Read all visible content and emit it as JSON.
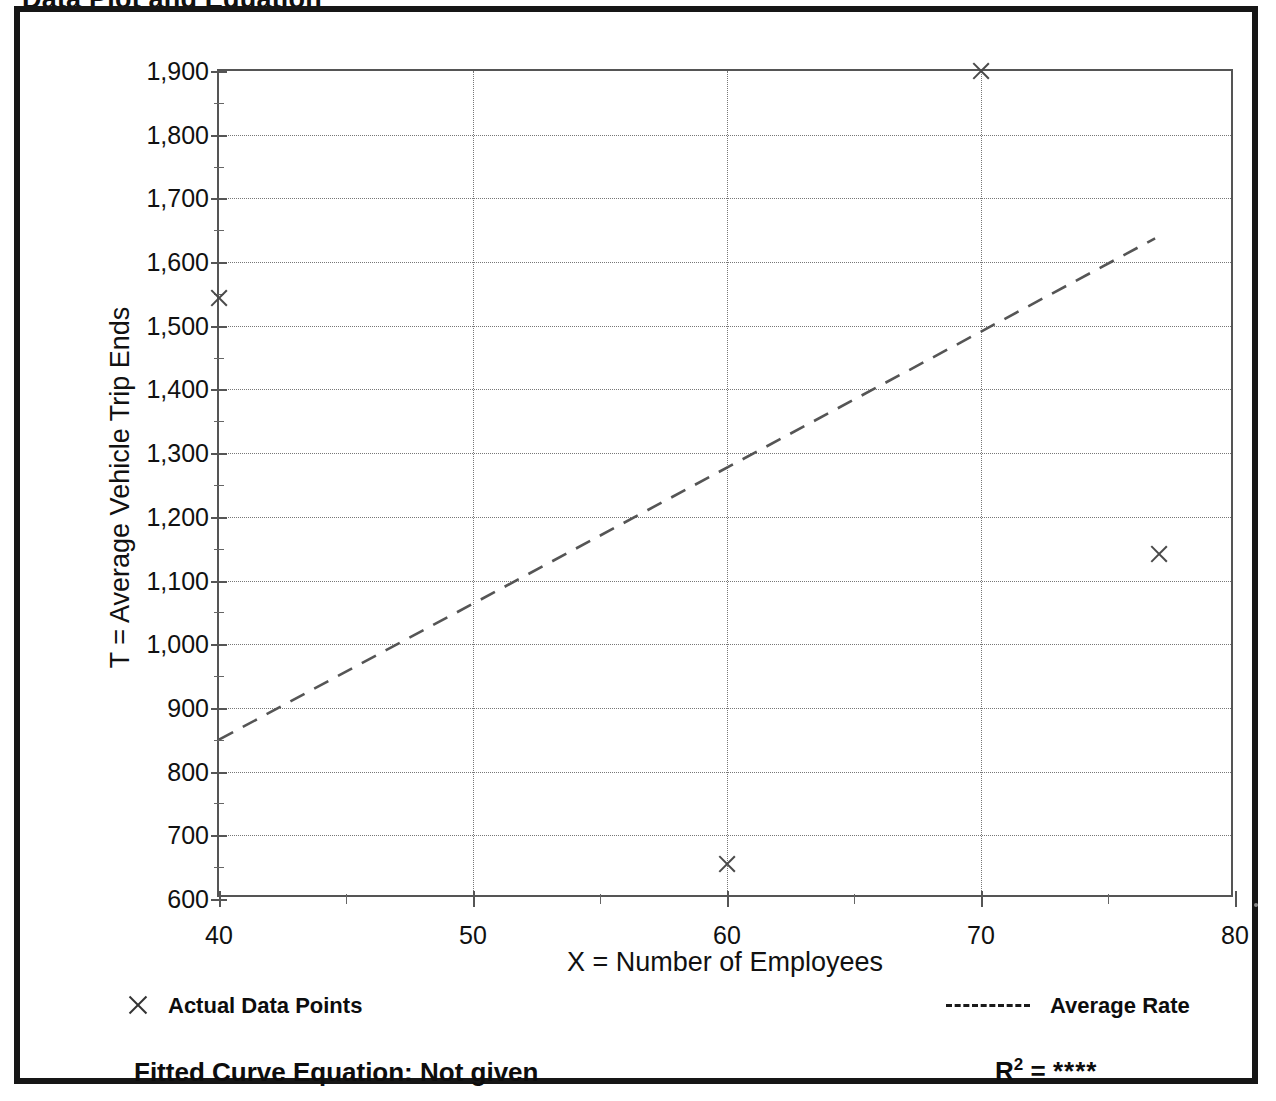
{
  "page": {
    "title": "Data Plot and Equation"
  },
  "chart_data": {
    "type": "scatter",
    "title": "Data Plot and Equation",
    "xlabel": "X = Number of Employees",
    "ylabel": "T = Average Vehicle Trip Ends",
    "xlim": [
      40,
      80
    ],
    "ylim": [
      600,
      1900
    ],
    "x_ticks": [
      40,
      50,
      60,
      70,
      80
    ],
    "x_tick_labels": [
      "40",
      "50",
      "60",
      "70",
      "80"
    ],
    "x_minor_ticks": [
      45,
      55,
      65,
      75
    ],
    "y_ticks": [
      600,
      700,
      800,
      900,
      1000,
      1100,
      1200,
      1300,
      1400,
      1500,
      1600,
      1700,
      1800,
      1900
    ],
    "y_tick_labels": [
      "600",
      "700",
      "800",
      "900",
      "1,000",
      "1,100",
      "1,200",
      "1,300",
      "1,400",
      "1,500",
      "1,600",
      "1,700",
      "1,800",
      "1,900"
    ],
    "grid": true,
    "grid_style": "dotted",
    "legend_position": "below-axes",
    "series": [
      {
        "name": "Actual Data Points",
        "type": "scatter",
        "marker": "x",
        "points": [
          {
            "x": 40,
            "y": 1543
          },
          {
            "x": 60,
            "y": 655
          },
          {
            "x": 70,
            "y": 1905
          },
          {
            "x": 77,
            "y": 1142
          }
        ]
      },
      {
        "name": "Average Rate",
        "type": "line",
        "style": "dashed",
        "endpoints": [
          {
            "x": 40,
            "y": 845
          },
          {
            "x": 77,
            "y": 1636
          }
        ]
      }
    ]
  },
  "legend": {
    "data_points_label": "Actual Data Points",
    "average_rate_label": "Average Rate",
    "marker_icon": "x-marker-icon",
    "line_icon": "dashed-line-icon"
  },
  "footer": {
    "fitted_equation": "Fitted Curve Equation:  Not given",
    "r_squared_symbol": "R",
    "r_squared_exponent": "2",
    "r_squared_equals": " = ",
    "r_squared_value": "****"
  },
  "colors": {
    "frame": "#161616",
    "axis": "#555555",
    "grid": "#777777",
    "marker": "#4a4a4a",
    "trend_line": "#555555",
    "text": "#111111"
  }
}
